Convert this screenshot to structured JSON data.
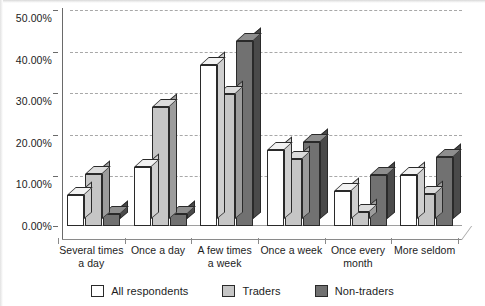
{
  "chart_data": {
    "type": "bar",
    "title": "",
    "subtitle": "",
    "xlabel": "",
    "ylabel": "",
    "ylim": [
      0,
      50
    ],
    "ytick_labels": [
      "0.00%",
      "10.00%",
      "20.00%",
      "30.00%",
      "40.00%",
      "50.00%"
    ],
    "ytick_values": [
      0,
      10,
      20,
      30,
      40,
      50
    ],
    "grid": true,
    "grid_style": "dashed horizontal",
    "legend_position": "bottom-center",
    "style": "3d-grouped-bar-grayscale",
    "categories": [
      "Several times a day",
      "Once a day",
      "A few times a week",
      "Once a week",
      "Once every month",
      "More seldom"
    ],
    "category_lines": [
      [
        "Several times",
        "a day"
      ],
      [
        "Once a day"
      ],
      [
        "A few times",
        "a week"
      ],
      [
        "Once a week"
      ],
      [
        "Once every",
        "month"
      ],
      [
        "More seldom"
      ]
    ],
    "series": [
      {
        "name": "All respondents",
        "color": "#ffffff",
        "values": [
          7.5,
          14.2,
          38.7,
          18.3,
          8.3,
          12.3
        ]
      },
      {
        "name": "Traders",
        "color": "#c6c6c6",
        "values": [
          12.5,
          28.5,
          31.8,
          16.0,
          3.3,
          7.8
        ]
      },
      {
        "name": "Non-traders",
        "color": "#717171",
        "values": [
          3.0,
          3.0,
          44.5,
          20.1,
          12.3,
          16.5
        ]
      }
    ]
  },
  "legend": {
    "items": [
      {
        "label": "All respondents",
        "color": "#ffffff"
      },
      {
        "label": "Traders",
        "color": "#c6c6c6"
      },
      {
        "label": "Non-traders",
        "color": "#717171"
      }
    ]
  }
}
